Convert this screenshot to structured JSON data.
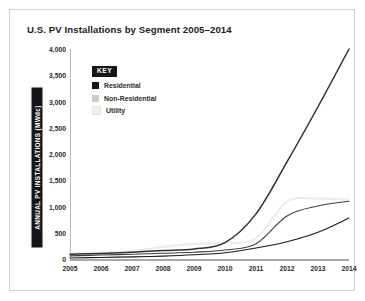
{
  "chart_data": {
    "type": "line",
    "title": "U.S. PV Installations by Segment 2005–2014",
    "xlabel": "",
    "ylabel": "ANNUAL PV INSTALLATIONS (MWdc)",
    "x": [
      2005,
      2006,
      2007,
      2008,
      2009,
      2010,
      2011,
      2012,
      2013,
      2014
    ],
    "xtick_labels": [
      "2005",
      "2006",
      "2007",
      "2008",
      "2009",
      "2010",
      "2011",
      "2012",
      "2013",
      "2014"
    ],
    "ytick_labels": [
      "0",
      "500",
      "1,000",
      "1,500",
      "2,000",
      "2,500",
      "3,000",
      "3,500",
      "4,000"
    ],
    "yticks": [
      0,
      500,
      1000,
      1500,
      2000,
      2500,
      3000,
      3500,
      4000
    ],
    "ylim": [
      0,
      4000
    ],
    "xlim": [
      2005,
      2014
    ],
    "grid": false,
    "legend_position": "top-left",
    "legend_title": "KEY",
    "series": [
      {
        "name": "Residential",
        "color": "#1b1b1b",
        "values": [
          20,
          30,
          40,
          55,
          80,
          120,
          210,
          330,
          510,
          780
        ]
      },
      {
        "name": "Non-Residential",
        "color": "#3f3f3f",
        "values": [
          60,
          75,
          90,
          110,
          130,
          170,
          290,
          820,
          1010,
          1100
        ]
      },
      {
        "name": "Utility",
        "color": "#ededed",
        "values": [
          110,
          120,
          150,
          230,
          290,
          310,
          390,
          1090,
          1150,
          1130
        ]
      },
      {
        "name": "Total",
        "color": "#303030",
        "values": [
          90,
          105,
          130,
          160,
          190,
          310,
          860,
          1850,
          2900,
          4000
        ]
      }
    ],
    "annotations": []
  },
  "legend": {
    "title": "KEY",
    "entries": [
      {
        "label": "Residential",
        "swatch": "#16161a"
      },
      {
        "label": "Non-Residential",
        "swatch": "#c9c9c9"
      },
      {
        "label": "Utility",
        "swatch": "#f0f0f0"
      }
    ]
  },
  "colors": {
    "frame_border": "#d0d0d0",
    "axis": "#b9b9b9",
    "text": "#1b1b1b",
    "chip_bg": "#16161a"
  }
}
